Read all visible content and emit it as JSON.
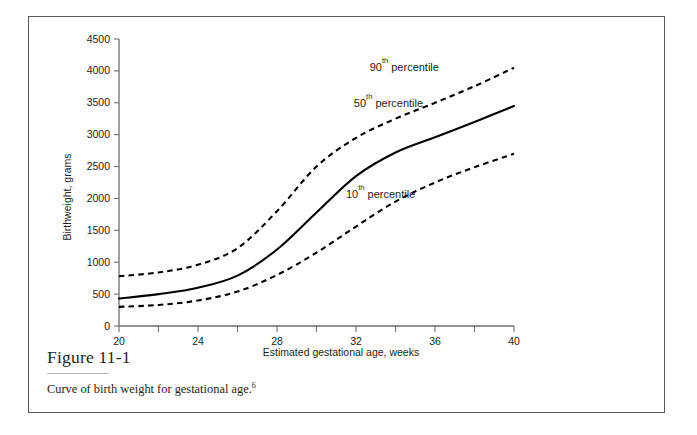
{
  "figure": {
    "number_label": "Figure 11-1",
    "caption_text": "Curve of birth weight for gestational age.",
    "caption_superscript": "6"
  },
  "chart_data": {
    "type": "line",
    "title": "",
    "xlabel": "Estimated gestational age, weeks",
    "ylabel": "Birthweight, grams",
    "xlim": [
      20,
      40
    ],
    "ylim": [
      0,
      4500
    ],
    "grid": false,
    "legend_position": "inline-annotations",
    "xticks": [
      20,
      22,
      24,
      26,
      28,
      30,
      32,
      34,
      36,
      38,
      40
    ],
    "xtick_labels": [
      "20",
      "",
      "24",
      "",
      "28",
      "",
      "32",
      "",
      "36",
      "",
      "40"
    ],
    "yticks": [
      0,
      500,
      1000,
      1500,
      2000,
      2500,
      3000,
      3500,
      4000,
      4500
    ],
    "ytick_labels": [
      "0",
      "500",
      "1000",
      "1500",
      "2000",
      "2500",
      "3000",
      "3500",
      "4000",
      "4500"
    ],
    "x": [
      20,
      22,
      24,
      26,
      28,
      30,
      32,
      34,
      36,
      38,
      40
    ],
    "series": [
      {
        "name": "90th percentile",
        "label_prefix": "90",
        "label_superscript": "th",
        "label_suffix": " percentile",
        "style": "dashed",
        "color": "#000000",
        "values": [
          780,
          840,
          960,
          1220,
          1800,
          2500,
          2950,
          3250,
          3500,
          3760,
          4050
        ]
      },
      {
        "name": "50th percentile",
        "label_prefix": "50",
        "label_superscript": "th",
        "label_suffix": " percentile",
        "style": "solid",
        "color": "#000000",
        "values": [
          430,
          500,
          600,
          790,
          1200,
          1780,
          2350,
          2720,
          2960,
          3200,
          3450
        ]
      },
      {
        "name": "10th percentile",
        "label_prefix": "10",
        "label_superscript": "th",
        "label_suffix": " percentile",
        "style": "dashed",
        "color": "#000000",
        "values": [
          300,
          330,
          400,
          540,
          800,
          1150,
          1560,
          1950,
          2250,
          2490,
          2700
        ]
      }
    ],
    "annotations": [
      {
        "text": "90th percentile",
        "x": 36.2,
        "y": 4050
      },
      {
        "text": "50th percentile",
        "x": 35.4,
        "y": 3480
      },
      {
        "text": "10th percentile",
        "x": 35.0,
        "y": 2060
      }
    ]
  }
}
